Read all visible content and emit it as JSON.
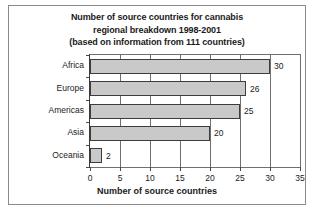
{
  "chart_data": {
    "type": "bar",
    "orientation": "horizontal",
    "title_lines": [
      "Number of source countries for cannabis",
      "regional breakdown 1998-2001",
      "(based on information from 111 countries)"
    ],
    "categories": [
      "Africa",
      "Europe",
      "Americas",
      "Asia",
      "Oceania"
    ],
    "values": [
      30,
      26,
      25,
      20,
      2
    ],
    "value_labels": [
      "30",
      "26",
      "25",
      "20",
      "2"
    ],
    "xlabel": "Number of source countries",
    "ylabel": "",
    "xlim": [
      0,
      35
    ],
    "xticks": [
      0,
      5,
      10,
      15,
      20,
      25,
      30,
      35
    ],
    "xtick_labels": [
      "0",
      "5",
      "10",
      "15",
      "20",
      "25",
      "30",
      "35"
    ],
    "grid": "vertical",
    "legend": null,
    "bar_color": "#c9c9c9",
    "bar_edge_color": "#3d3d3d",
    "axis_color": "#4a4a4a",
    "text_color": "#1a1a1a"
  }
}
